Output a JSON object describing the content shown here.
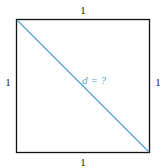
{
  "diagram": {
    "shape": "square",
    "side_labels": {
      "top": "1",
      "left": "1",
      "right": "1",
      "bottom": "1"
    },
    "diagonal_label": "d = ?",
    "colors": {
      "outline": "#111111",
      "diagonal": "#4fa8cc",
      "diagonal_label": "#4fa8cc"
    }
  }
}
